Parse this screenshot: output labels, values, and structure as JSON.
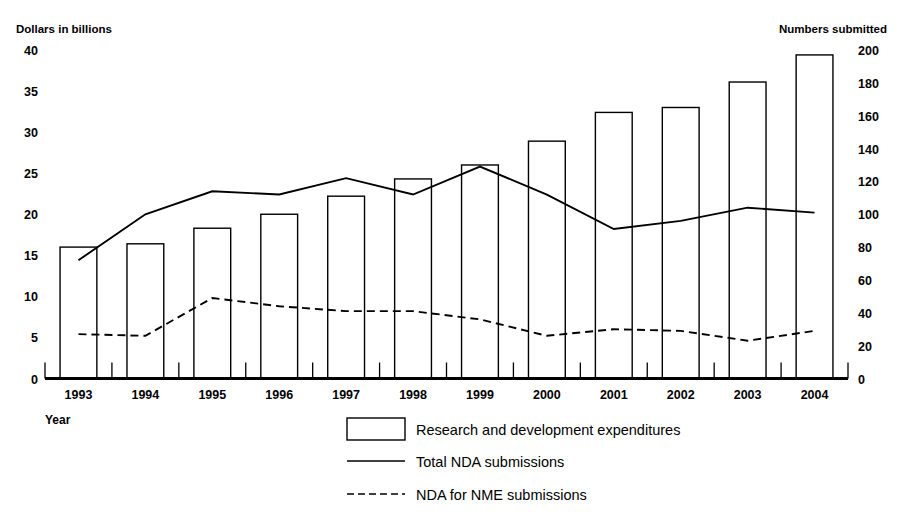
{
  "chart_data": {
    "type": "bar",
    "title": "",
    "xlabel": "Year",
    "ylabel_left": "Dollars in billions",
    "ylabel_right": "Numbers submitted",
    "categories": [
      "1993",
      "1994",
      "1995",
      "1996",
      "1997",
      "1998",
      "1999",
      "2000",
      "2001",
      "2002",
      "2003",
      "2004"
    ],
    "ylim_left": [
      0,
      40
    ],
    "ylim_right": [
      0,
      200
    ],
    "yticks_left": [
      0,
      5,
      10,
      15,
      20,
      25,
      30,
      35,
      40
    ],
    "yticks_right": [
      0,
      20,
      40,
      60,
      80,
      100,
      120,
      140,
      160,
      180,
      200
    ],
    "grid": false,
    "legend_position": "bottom",
    "series": [
      {
        "name": "Research and development expenditures",
        "kind": "bar",
        "axis": "left",
        "unit": "Dollars in billions",
        "values": [
          16.0,
          16.4,
          18.3,
          20.0,
          22.2,
          24.3,
          26.0,
          28.9,
          32.4,
          33.0,
          36.1,
          39.4
        ]
      },
      {
        "name": "Total NDA submissions",
        "kind": "line-solid",
        "axis": "right",
        "unit": "Numbers submitted",
        "values": [
          72,
          100,
          114,
          112,
          122,
          112,
          129,
          112,
          91,
          96,
          104,
          101
        ]
      },
      {
        "name": "NDA for NME submissions",
        "kind": "line-dashed",
        "axis": "right",
        "unit": "Numbers submitted",
        "values": [
          27,
          26,
          49,
          44,
          41,
          41,
          36,
          26,
          30,
          29,
          23,
          29
        ]
      }
    ]
  },
  "axes": {
    "left_title": "Dollars in billions",
    "right_title": "Numbers submitted",
    "x_caption": "Year"
  },
  "legend": {
    "items": [
      {
        "label": "Research and development expenditures",
        "marker": "box-outline-swatch"
      },
      {
        "label": "Total NDA submissions",
        "marker": "solid-line-swatch"
      },
      {
        "label": "NDA for NME submissions",
        "marker": "dashed-line-swatch"
      }
    ]
  }
}
